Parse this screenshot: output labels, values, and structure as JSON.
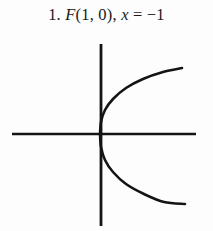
{
  "figure": {
    "background_color": "#fdfdfd",
    "ink_color": "#141414",
    "caption": {
      "full_text": "1. F(1, 0), x = −1",
      "item_number": "1.",
      "focus_label": "F",
      "focus_point": "(1, 0)",
      "separator": ",",
      "directrix_variable": "x",
      "equals": "=",
      "directrix_value": "−1"
    }
  },
  "chart_data": {
    "type": "line",
    "subtitle": "",
    "xlabel": "",
    "ylabel": "",
    "grid": false,
    "legend": false,
    "legend_position": "none",
    "axes": {
      "x_axis": {
        "from_px": [
          12,
          104
        ],
        "to_px": [
          196,
          104
        ],
        "tick_labels": [],
        "visible": true
      },
      "y_axis": {
        "from_px": [
          101,
          14
        ],
        "to_px": [
          101,
          196
        ],
        "tick_labels": [],
        "visible": true
      },
      "origin_px": [
        101,
        104
      ],
      "xlim": [
        -2.2,
        2.1
      ],
      "ylim": [
        -2.0,
        2.0
      ]
    },
    "series": [
      {
        "name": "parabola y^2 = 4x",
        "equation": "y^2 = 4x",
        "vertex": [
          0,
          0
        ],
        "focus": [
          1,
          0
        ],
        "directrix": "x = -1",
        "opens": "right",
        "x": [
          0,
          0.06,
          0.14,
          0.25,
          0.4,
          0.6,
          0.85,
          1.15,
          1.5,
          1.9
        ],
        "y_upper": [
          0,
          0.49,
          0.75,
          1.0,
          1.26,
          1.55,
          1.84,
          2.14,
          2.45,
          2.76
        ],
        "y_lower": [
          0,
          -0.49,
          -0.75,
          -1.0,
          -1.26,
          -1.55,
          -1.84,
          -2.14,
          -2.45,
          -2.76
        ],
        "upper_branch_px": [
          [
            100,
            104
          ],
          [
            101,
            92
          ],
          [
            105,
            80
          ],
          [
            113,
            69
          ],
          [
            126,
            58
          ],
          [
            143,
            49
          ],
          [
            163,
            42
          ],
          [
            182,
            38
          ]
        ],
        "lower_branch_px": [
          [
            100,
            104
          ],
          [
            101,
            117
          ],
          [
            105,
            130
          ],
          [
            113,
            142
          ],
          [
            126,
            154
          ],
          [
            144,
            164
          ],
          [
            164,
            172
          ],
          [
            185,
            174
          ]
        ],
        "color": "#141414",
        "line_width_px": 2.6
      }
    ]
  }
}
